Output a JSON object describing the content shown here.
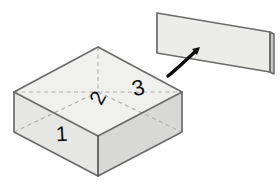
{
  "figure": {
    "background_color": "#ffffff"
  },
  "colors": {
    "face_top": "#f0f0ef",
    "face_front": "#e6e6e4",
    "face_right": "#d8d8d6",
    "plane_top": "#ececea",
    "plane_edge_side": "#c9c9c7",
    "edge_stroke": "#6b6b6b",
    "edge_stroke_dark": "#555555",
    "hidden_stroke": "#b0b0b0",
    "label_color": "#111111",
    "arrow_color": "#0d0d0d"
  },
  "box": {
    "name": "isometric-box",
    "top_face": {
      "name": "box-top-face",
      "points": "14,92 98,47 182,92 98,136"
    },
    "front_left_face": {
      "name": "box-front-left-face",
      "points": "14,92 98,136 98,176 14,132"
    },
    "front_right_face": {
      "name": "box-front-right-face",
      "points": "98,136 182,92 182,132 98,176"
    },
    "outline": "M14,92 L98,47 L182,92 L182,132 L98,176 L14,132 Z",
    "front_vertical_edge": "M98,136 L98,176",
    "front_top_left_edge": "M14,92 L98,136",
    "front_top_right_edge": "M98,136 L182,92",
    "hidden_edges": [
      {
        "name": "hidden-back-vertical-edge",
        "d": "M98,47 L98,92"
      },
      {
        "name": "hidden-back-left-diagonal",
        "d": "M14,92 L98,92"
      },
      {
        "name": "hidden-back-right-diagonal",
        "d": "M98,92 L182,92"
      },
      {
        "name": "hidden-bottom-back-left",
        "d": "M14,132 L98,92"
      },
      {
        "name": "hidden-bottom-back-right",
        "d": "M98,92 L182,132"
      }
    ]
  },
  "plane": {
    "name": "extracted-plane",
    "top_face_points": "157,13 270,32 270,72 157,53",
    "side_face_points": "270,32 274,34 274,74 270,72",
    "outline": "M157,13 L270,32 L270,72 L157,53 Z",
    "side_outline": "M270,32 L274,34 L274,74 L270,72 Z"
  },
  "arrow": {
    "name": "extraction-arrow",
    "path": "M168,76 C176,70 186,60 197,50",
    "head_points": "200,47 192,49 197,55",
    "direction": "up-right",
    "stroke_width": 3.4
  },
  "labels": [
    {
      "id": "label-1",
      "name": "face-label-1",
      "text": "1",
      "x": 62,
      "y": 141,
      "font_size": 21,
      "rotation": -3
    },
    {
      "id": "label-2",
      "name": "face-label-2",
      "text": "2",
      "x": 104,
      "y": 101,
      "font_size": 21,
      "rotation": -62
    },
    {
      "id": "label-3",
      "name": "face-label-3",
      "text": "3",
      "x": 140,
      "y": 95,
      "font_size": 22,
      "rotation": -14
    }
  ]
}
